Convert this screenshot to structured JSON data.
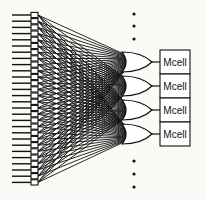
{
  "diagram": {
    "title": "",
    "colors": {
      "background": "#fbfaf6",
      "stroke": "#111111",
      "fill": "#ffffff"
    },
    "inputs": {
      "count": 28,
      "x_start": 12,
      "x_buffer": 31,
      "buffer_width": 7,
      "y_first": 15,
      "pitch": 6.2
    },
    "or_gates": [
      {
        "id": "or-1",
        "cy": 62
      },
      {
        "id": "or-2",
        "cy": 86
      },
      {
        "id": "or-3",
        "cy": 110
      },
      {
        "id": "or-4",
        "cy": 134
      }
    ],
    "gate_geometry": {
      "x": 122,
      "width": 30,
      "height": 20,
      "input_x": 126
    },
    "mcells": [
      {
        "label": "Mcell",
        "y": 50
      },
      {
        "label": "Mcell",
        "y": 74
      },
      {
        "label": "Mcell",
        "y": 98
      },
      {
        "label": "Mcell",
        "y": 122
      }
    ],
    "mcell_geometry": {
      "x": 160,
      "width": 30,
      "height": 24
    },
    "ellipsis_top": {
      "x": 134,
      "ys": [
        14,
        26,
        39
      ]
    },
    "ellipsis_bottom": {
      "x": 134,
      "ys": [
        161,
        174,
        187
      ]
    }
  }
}
